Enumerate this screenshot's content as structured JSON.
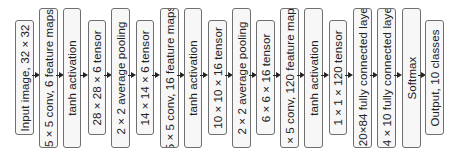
{
  "diagram": {
    "layout": {
      "short_box": {
        "top": 20,
        "height": 115
      },
      "tall_box": {
        "top": 8,
        "height": 140
      },
      "arrow_y": 75
    },
    "colors": {
      "box_fill": "#f7f7f7",
      "box_border": "#6f6f6f",
      "text": "#222222",
      "arrow": "#222222"
    },
    "boxes": [
      {
        "label": "Input image, 32 × 32",
        "kind": "short",
        "x": 15,
        "w": 19
      },
      {
        "label": "5 × 5 conv, 6 feature maps",
        "kind": "tall",
        "x": 39,
        "w": 19
      },
      {
        "label": "tanh activation",
        "kind": "tall",
        "x": 63,
        "w": 18
      },
      {
        "label": "28 × 28 × 6 tensor",
        "kind": "short",
        "x": 88,
        "w": 18
      },
      {
        "label": "2 × 2 average pooling",
        "kind": "tall",
        "x": 111,
        "w": 19
      },
      {
        "label": "14 × 14 × 6 tensor",
        "kind": "short",
        "x": 136,
        "w": 18
      },
      {
        "label": "5 × 5 conv, 16 feature maps",
        "kind": "tall",
        "x": 160,
        "w": 19
      },
      {
        "label": "tanh activation",
        "kind": "tall",
        "x": 184,
        "w": 18
      },
      {
        "label": "10 × 10 × 16 tensor",
        "kind": "short",
        "x": 208,
        "w": 19
      },
      {
        "label": "2 × 2 average pooling",
        "kind": "tall",
        "x": 232,
        "w": 19
      },
      {
        "label": "6 × 6 × 16 tensor",
        "kind": "short",
        "x": 256,
        "w": 19
      },
      {
        "label": "5 × 5 conv, 120 feature maps",
        "kind": "tall",
        "x": 280,
        "w": 19
      },
      {
        "label": "tanh activation",
        "kind": "tall",
        "x": 304,
        "w": 19
      },
      {
        "label": "1 × 1 × 120 tensor",
        "kind": "short",
        "x": 329,
        "w": 18
      },
      {
        "label": "120×84 fully connected layer",
        "kind": "tall",
        "x": 353,
        "w": 19
      },
      {
        "label": "84 × 10 fully connected layer",
        "kind": "tall",
        "x": 377,
        "w": 19
      },
      {
        "label": "Softmax",
        "kind": "tall",
        "x": 402,
        "w": 19
      },
      {
        "label": "Output, 10 classes",
        "kind": "short",
        "x": 425,
        "w": 19
      }
    ]
  }
}
